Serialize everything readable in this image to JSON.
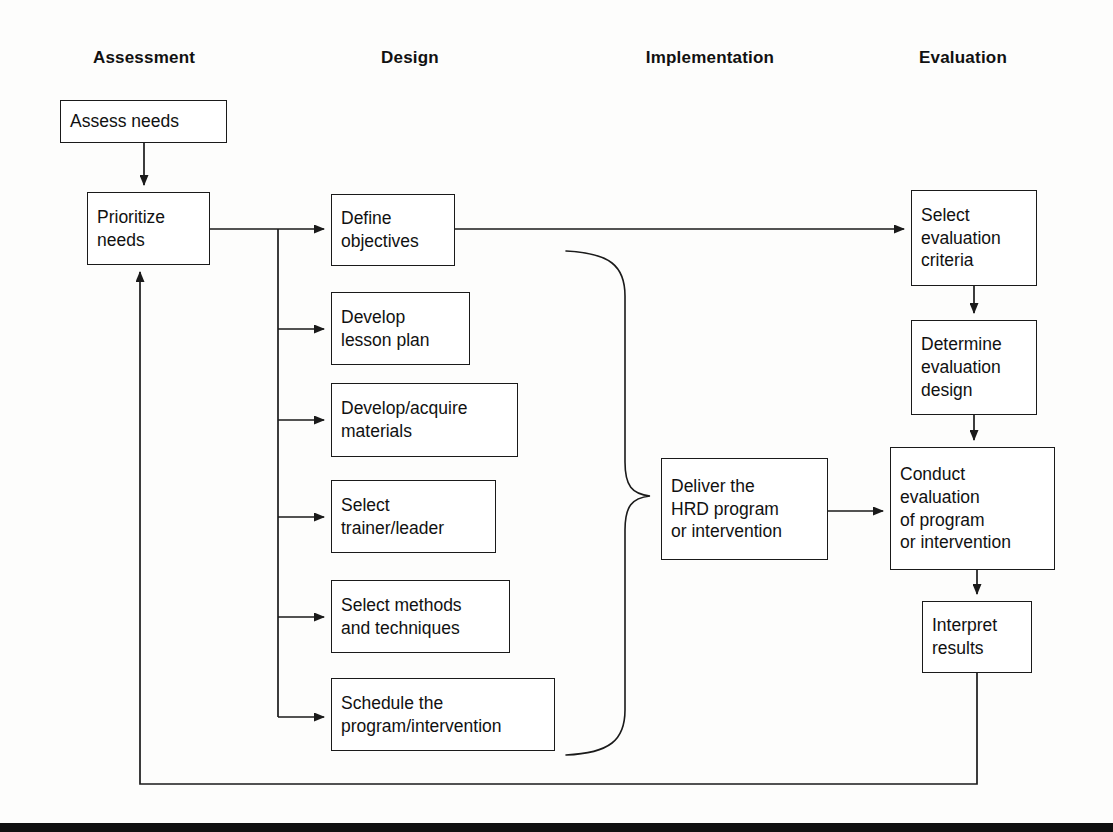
{
  "diagram": {
    "phases": [
      {
        "label": "Assessment",
        "cx": 144,
        "y": 48
      },
      {
        "label": "Design",
        "cx": 410,
        "y": 48
      },
      {
        "label": "Implementation",
        "cx": 710,
        "y": 48
      },
      {
        "label": "Evaluation",
        "cx": 963,
        "y": 48
      }
    ],
    "nodes": [
      {
        "id": "assess-needs",
        "lines": [
          "Assess needs"
        ],
        "x": 60,
        "y": 100,
        "w": 167,
        "h": 43
      },
      {
        "id": "prioritize-needs",
        "lines": [
          "Prioritize",
          "needs"
        ],
        "x": 87,
        "y": 192,
        "w": 123,
        "h": 73
      },
      {
        "id": "define-objectives",
        "lines": [
          "Define",
          "objectives"
        ],
        "x": 331,
        "y": 194,
        "w": 124,
        "h": 72
      },
      {
        "id": "develop-lesson-plan",
        "lines": [
          "Develop",
          "lesson plan"
        ],
        "x": 331,
        "y": 292,
        "w": 139,
        "h": 73
      },
      {
        "id": "develop-acquire-materials",
        "lines": [
          "Develop/acquire",
          "materials"
        ],
        "x": 331,
        "y": 383,
        "w": 187,
        "h": 74
      },
      {
        "id": "select-trainer-leader",
        "lines": [
          "Select",
          "trainer/leader"
        ],
        "x": 331,
        "y": 480,
        "w": 165,
        "h": 73
      },
      {
        "id": "select-methods-techniques",
        "lines": [
          "Select methods",
          "and techniques"
        ],
        "x": 331,
        "y": 580,
        "w": 179,
        "h": 73
      },
      {
        "id": "schedule-program",
        "lines": [
          "Schedule the",
          "program/intervention"
        ],
        "x": 331,
        "y": 678,
        "w": 224,
        "h": 73
      },
      {
        "id": "deliver-hrd-program",
        "lines": [
          "Deliver the",
          "HRD program",
          "or intervention"
        ],
        "x": 661,
        "y": 458,
        "w": 167,
        "h": 102
      },
      {
        "id": "select-evaluation-criteria",
        "lines": [
          "Select",
          "evaluation",
          "criteria"
        ],
        "x": 911,
        "y": 190,
        "w": 126,
        "h": 96
      },
      {
        "id": "determine-evaluation-design",
        "lines": [
          "Determine",
          "evaluation",
          "design"
        ],
        "x": 911,
        "y": 320,
        "w": 126,
        "h": 95
      },
      {
        "id": "conduct-evaluation",
        "lines": [
          "Conduct",
          "evaluation",
          "of program",
          "or intervention"
        ],
        "x": 890,
        "y": 447,
        "w": 165,
        "h": 123
      },
      {
        "id": "interpret-results",
        "lines": [
          "Interpret",
          "results"
        ],
        "x": 922,
        "y": 601,
        "w": 110,
        "h": 72
      }
    ],
    "connectors": [
      {
        "id": "assess-to-prioritize",
        "kind": "arrow-down"
      },
      {
        "id": "prioritize-to-design-bus",
        "kind": "line-right"
      },
      {
        "id": "bus-to-define-objectives",
        "kind": "arrow-right"
      },
      {
        "id": "bus-to-develop-lesson-plan",
        "kind": "arrow-right"
      },
      {
        "id": "bus-to-develop-acquire-materials",
        "kind": "arrow-right"
      },
      {
        "id": "bus-to-select-trainer-leader",
        "kind": "arrow-right"
      },
      {
        "id": "bus-to-select-methods-techniques",
        "kind": "arrow-right"
      },
      {
        "id": "bus-to-schedule-program",
        "kind": "arrow-right"
      },
      {
        "id": "define-objectives-to-select-criteria",
        "kind": "arrow-right-long"
      },
      {
        "id": "design-brace-to-deliver",
        "kind": "brace"
      },
      {
        "id": "deliver-to-conduct-evaluation",
        "kind": "arrow-right"
      },
      {
        "id": "select-criteria-to-determine-design",
        "kind": "arrow-down"
      },
      {
        "id": "determine-design-to-conduct-evaluation",
        "kind": "arrow-down"
      },
      {
        "id": "conduct-evaluation-to-interpret-results",
        "kind": "arrow-down"
      },
      {
        "id": "interpret-results-feedback-to-prioritize",
        "kind": "feedback-loop"
      }
    ],
    "colors": {
      "stroke": "#1a1a1a",
      "background": "#ffffff",
      "text": "#111111",
      "rule": "#101010"
    },
    "footer_rule": {
      "y": 823,
      "height": 9
    }
  }
}
